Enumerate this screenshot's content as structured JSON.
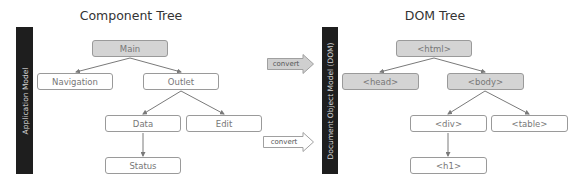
{
  "component_tree": {
    "title": "Component Tree",
    "side_label": "Application Model",
    "nodes": {
      "main": "Main",
      "navigation": "Navigation",
      "outlet": "Outlet",
      "data": "Data",
      "edit": "Edit",
      "status": "Status"
    }
  },
  "arrows": {
    "top": "convert",
    "bottom": "convert"
  },
  "dom_tree": {
    "title": "DOM Tree",
    "side_label": "Document Object Model (DOM)",
    "nodes": {
      "html": "<html>",
      "head": "<head>",
      "body": "<body>",
      "div": "<div>",
      "table": "<table>",
      "h1": "<h1>"
    }
  },
  "colors": {
    "highlight_fill": "#d4d4d4",
    "sidebar": "#1e1e1e",
    "border": "#9a9a9a"
  }
}
